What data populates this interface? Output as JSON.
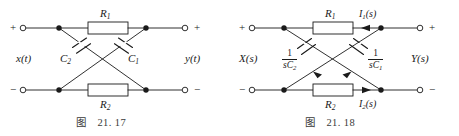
{
  "page": {
    "background": "#ffffff",
    "ink": "#1a1a1a",
    "width": 459,
    "height": 136
  },
  "figures": [
    {
      "id": "figure-left",
      "caption_prefix": "图",
      "caption_number": "21. 17",
      "title": "Lattice network in time domain",
      "terminals": {
        "input_plus": "+",
        "input_minus": "−",
        "output_plus": "+",
        "output_minus": "−"
      },
      "ports": {
        "input_signal": "x(t)",
        "output_signal": "y(t)"
      },
      "components": [
        {
          "name": "R1",
          "label_main": "R",
          "label_sub": "1",
          "kind": "resistor",
          "position": "top-branch"
        },
        {
          "name": "R2",
          "label_main": "R",
          "label_sub": "2",
          "kind": "resistor",
          "position": "bottom-branch"
        },
        {
          "name": "C2",
          "label_main": "C",
          "label_sub": "2",
          "kind": "capacitor",
          "position": "diagonal-left"
        },
        {
          "name": "C1",
          "label_main": "C",
          "label_sub": "1",
          "kind": "capacitor",
          "position": "diagonal-right"
        }
      ]
    },
    {
      "id": "figure-right",
      "caption_prefix": "图",
      "caption_number": "21. 18",
      "title": "Lattice network in s domain",
      "terminals": {
        "input_plus": "+",
        "input_minus": "−",
        "output_plus": "+",
        "output_minus": "−"
      },
      "ports": {
        "input_signal": "X(s)",
        "output_signal": "Y(s)"
      },
      "components": [
        {
          "name": "R1",
          "label_main": "R",
          "label_sub": "1",
          "kind": "resistor",
          "position": "top-branch"
        },
        {
          "name": "R2",
          "label_main": "R",
          "label_sub": "2",
          "kind": "resistor",
          "position": "bottom-branch"
        },
        {
          "name": "Z2",
          "numerator": "1",
          "denominator_main": "sC",
          "denominator_sub": "2",
          "kind": "impedance",
          "position": "diagonal-left"
        },
        {
          "name": "Z1",
          "numerator": "1",
          "denominator_main": "sC",
          "denominator_sub": "1",
          "kind": "impedance",
          "position": "diagonal-right"
        }
      ],
      "currents": [
        {
          "name": "I1",
          "label_main": "I",
          "label_sub": "1",
          "label_arg": "(s)",
          "direction": "right",
          "position": "top-branch"
        },
        {
          "name": "I2",
          "label_main": "I",
          "label_sub": "2",
          "label_arg": "(s)",
          "direction": "left",
          "position": "bottom-branch"
        }
      ]
    }
  ]
}
